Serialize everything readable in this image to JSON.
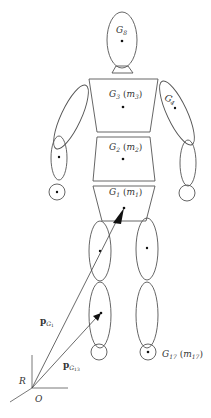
{
  "diagram": {
    "type": "human-body-segment-model",
    "labels": {
      "head": {
        "base": "G",
        "sub": "8"
      },
      "chest": {
        "base": "G",
        "sub": "3",
        "mass_base": "m",
        "mass_sub": "3"
      },
      "upper_arm_right": {
        "base": "G",
        "sub": "4"
      },
      "abdomen": {
        "base": "G",
        "sub": "2",
        "mass_base": "m",
        "mass_sub": "2"
      },
      "pelvis": {
        "base": "G",
        "sub": "1",
        "mass_base": "m",
        "mass_sub": "1"
      },
      "foot_right": {
        "base": "G",
        "sub": "17",
        "mass_base": "m",
        "mass_sub": "17"
      },
      "vector_g1": {
        "base": "p",
        "sub": "G",
        "subsub": "1"
      },
      "vector_g13": {
        "base": "p",
        "sub": "G",
        "subsub": "13"
      },
      "frame": "R",
      "origin": "O"
    },
    "colors": {
      "stroke": "#555555",
      "dot": "#111111",
      "text": "#333333",
      "background": "#ffffff"
    }
  }
}
